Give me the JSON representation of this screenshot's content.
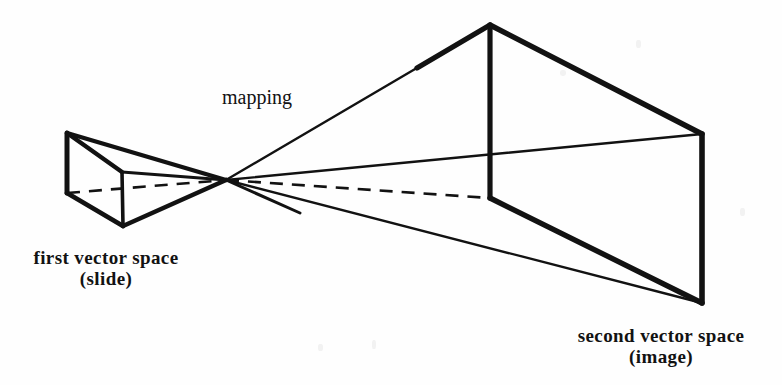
{
  "figure": {
    "background_color": "#fefefe",
    "ink_color": "#121212",
    "labels": {
      "mapping": "mapping",
      "first_space_line1": "first vector space",
      "first_space_line2": "(slide)",
      "second_space_line1": "second vector space",
      "second_space_line2": "(image)"
    },
    "geometry": {
      "convergence_point": [
        226,
        180
      ],
      "first_box": {
        "name": "slide",
        "back_top_left": [
          67,
          133
        ],
        "back_bottom_left": [
          67,
          193
        ],
        "front_top": [
          122,
          172
        ],
        "front_bottom": [
          122,
          216
        ],
        "front_bottom_tip": [
          123,
          226
        ],
        "back_top_right": [
          122,
          172
        ]
      },
      "second_box": {
        "name": "image",
        "apex_top": [
          490,
          25
        ],
        "mid_vertical_bottom": [
          490,
          197
        ],
        "right_top": [
          702,
          134
        ],
        "right_bottom": [
          702,
          303
        ]
      },
      "dashed_edge": {
        "from": [
          67,
          193
        ],
        "via": [
          226,
          180
        ],
        "to": [
          490,
          197
        ]
      }
    }
  }
}
